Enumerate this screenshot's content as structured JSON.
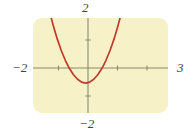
{
  "figure": {
    "background_color": "#ffffff",
    "plot_background_color": "#f6f1c6",
    "curve_color": "#c0392b",
    "axis_color": "#8a8a6e",
    "label_color": "#4a4338"
  },
  "labels": {
    "y_max": "2",
    "y_min": "−2",
    "x_min": "−2",
    "x_max": "3"
  },
  "chart_data": {
    "type": "line",
    "title": "",
    "xlabel": "",
    "ylabel": "",
    "xlim": [
      -2,
      3
    ],
    "ylim": [
      -2,
      2
    ],
    "grid": false,
    "legend": "none",
    "x_ticks": [
      -2,
      -1,
      0,
      1,
      2,
      3
    ],
    "y_ticks": [
      -2,
      -1,
      0,
      1,
      2
    ],
    "x_tick_labels": [
      "−2",
      "",
      "",
      "",
      "",
      "3"
    ],
    "y_tick_labels": [
      "−2",
      "",
      "",
      "",
      "2"
    ],
    "annotations": [
      {
        "text": "vertex",
        "x": 0.3,
        "y": -1.35
      },
      {
        "text": "x-intercept",
        "x": -0.75,
        "y": 0
      },
      {
        "text": "x-intercept",
        "x": 1.35,
        "y": 0
      }
    ],
    "series": [
      {
        "name": "parabola",
        "color": "#c0392b",
        "equation": "y = 1.3(x - 0.3)^2 - 1.35",
        "x": [
          -1.85,
          -1.7,
          -1.55,
          -1.4,
          -1.25,
          -1.1,
          -0.95,
          -0.8,
          -0.65,
          -0.5,
          -0.35,
          -0.2,
          -0.05,
          0.1,
          0.25,
          0.4,
          0.55,
          0.7,
          0.85,
          1.0,
          1.15,
          1.3,
          1.45,
          1.6,
          1.75,
          1.9,
          2.05,
          2.2,
          2.35
        ],
        "values": [
          4.72,
          3.85,
          3.05,
          2.33,
          1.68,
          1.11,
          0.62,
          0.21,
          -0.13,
          -0.39,
          -0.58,
          -0.7,
          -0.74,
          -0.7,
          -0.58,
          -0.39,
          -0.13,
          0.21,
          0.62,
          1.11,
          1.68,
          2.33,
          3.05,
          3.85,
          4.72,
          5.67,
          6.69,
          7.78,
          8.95
        ]
      }
    ]
  }
}
